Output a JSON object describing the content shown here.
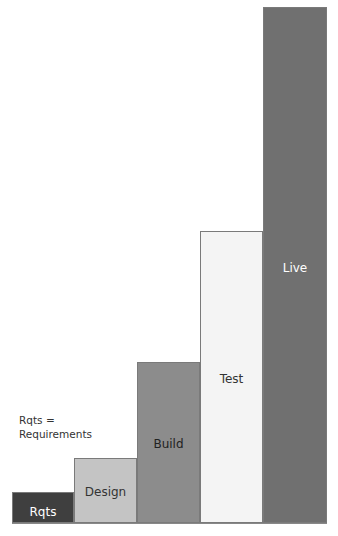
{
  "note": {
    "line1": "Rqts =",
    "line2": "Requirements"
  },
  "bars": [
    {
      "label": "Rqts",
      "left": 12,
      "width": 62,
      "top": 492,
      "color": "#3f3f3f",
      "text_color": "#ffffff",
      "label_offset": 12
    },
    {
      "label": "Design",
      "left": 74,
      "width": 63,
      "top": 458,
      "color": "#c4c4c4",
      "text_color": "#333333",
      "label_offset": 26
    },
    {
      "label": "Build",
      "left": 137,
      "width": 63,
      "top": 362,
      "color": "#8c8c8c",
      "text_color": "#222222",
      "label_offset": 74
    },
    {
      "label": "Test",
      "left": 200,
      "width": 63,
      "top": 231,
      "color": "#f4f4f4",
      "text_color": "#333333",
      "label_offset": 140
    },
    {
      "label": "Live",
      "left": 263,
      "width": 64,
      "top": 7,
      "color": "#707070",
      "text_color": "#ffffff",
      "label_offset": 253
    }
  ],
  "baseline_y": 523
}
